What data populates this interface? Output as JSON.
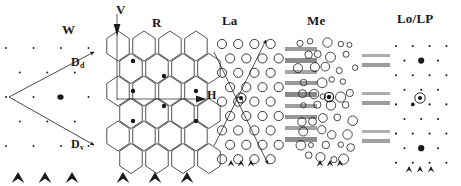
{
  "figure": {
    "width": 461,
    "height": 186,
    "background": "#ffffff",
    "ink": "#1a1a1a",
    "gray_bar_color": "#a8a8a8"
  },
  "regions": [
    {
      "key": "W",
      "label": "W",
      "label_x": 62,
      "label_y": 22,
      "motif": "sparse-dots-with-vector-arrows",
      "description": "Sparse point lattice with two vectors emanating from a common vertex"
    },
    {
      "key": "R",
      "label": "R",
      "label_x": 152,
      "label_y": 17,
      "motif": "honeycomb-hexagon-lattice",
      "description": "Hexagonal honeycomb tiling with filled centre dots"
    },
    {
      "key": "La",
      "label": "La",
      "label_x": 222,
      "label_y": 15,
      "motif": "circle-lattice",
      "description": "Regular lattice of open circles with diagonal vectors"
    },
    {
      "key": "Me",
      "label": "Me",
      "label_x": 307,
      "label_y": 15,
      "motif": "disordered-circles",
      "description": "Disordered circles of varying radii"
    },
    {
      "key": "LoLP",
      "label": "Lo/LP",
      "label_x": 399,
      "label_y": 13,
      "motif": "diffraction-spots",
      "description": "Spot pattern with strong corner reflections and circled origin"
    }
  ],
  "axes": {
    "v_axis": {
      "label": "V",
      "label_x": 116,
      "label_y": 4,
      "direction": "down"
    },
    "h_axis": {
      "label": "H",
      "label_x": 206,
      "label_y": 94,
      "direction": "right"
    }
  },
  "vectors": [
    {
      "name": "Dd",
      "label": "D",
      "subscript": "d",
      "label_x": 72,
      "label_y": 58,
      "from_x": 9,
      "from_y": 97,
      "to_x": 94,
      "to_y": 52
    },
    {
      "name": "Dv",
      "label": "D",
      "subscript": "v",
      "label_x": 72,
      "label_y": 140,
      "from_x": 9,
      "from_y": 97,
      "to_x": 94,
      "to_y": 145
    }
  ],
  "arrowhead_groups": [
    {
      "region": "W",
      "x_positions": [
        18,
        45,
        72
      ],
      "y": 172,
      "size": "large"
    },
    {
      "region": "R",
      "x_positions": [
        123,
        155,
        187
      ],
      "y": 172,
      "size": "large"
    },
    {
      "region": "La",
      "x_positions": [
        231,
        241,
        251
      ],
      "y": 160,
      "size": "small"
    },
    {
      "region": "Me",
      "x_positions": [
        320,
        330,
        340
      ],
      "y": 160,
      "size": "small"
    },
    {
      "region": "LoLP",
      "x_positions": [
        409,
        420,
        431
      ],
      "y": 166,
      "size": "small"
    }
  ],
  "gray_bar_columns": [
    {
      "name": "La-to-Me-bars",
      "x": 285,
      "width": 32,
      "bars": [
        {
          "y": 47,
          "h": 4,
          "shade": "#9a9a9a"
        },
        {
          "y": 58,
          "h": 5,
          "shade": "#8d8d8d"
        },
        {
          "y": 70,
          "h": 4,
          "shade": "#a5a5a5"
        },
        {
          "y": 81,
          "h": 4,
          "shade": "#999999"
        },
        {
          "y": 92,
          "h": 5,
          "shade": "#8a8a8a"
        },
        {
          "y": 104,
          "h": 4,
          "shade": "#a0a0a0"
        },
        {
          "y": 115,
          "h": 4,
          "shade": "#969696"
        },
        {
          "y": 126,
          "h": 4,
          "shade": "#a3a3a3"
        },
        {
          "y": 137,
          "h": 5,
          "shade": "#8f8f8f"
        }
      ]
    },
    {
      "name": "Me-to-LoLP-bars",
      "x": 362,
      "width": 28,
      "bars": [
        {
          "y": 54,
          "h": 3,
          "shade": "#aeaeae"
        },
        {
          "y": 63,
          "h": 4,
          "shade": "#9b9b9b"
        },
        {
          "y": 92,
          "h": 3,
          "shade": "#adadad"
        },
        {
          "y": 101,
          "h": 4,
          "shade": "#9d9d9d"
        },
        {
          "y": 130,
          "h": 3,
          "shade": "#b0b0b0"
        },
        {
          "y": 139,
          "h": 4,
          "shade": "#a0a0a0"
        }
      ]
    }
  ],
  "lattices": {
    "W_dots": {
      "note": "sparse dot array, one bold central dot",
      "center_dot": {
        "x": 60,
        "y": 97,
        "r": 2.6
      }
    },
    "R_hex": {
      "cols": 4,
      "rows": 7,
      "hex_radius": 15,
      "filled_dot_radius": 2.2
    },
    "La_circles": {
      "cols": 5,
      "rows": 9,
      "circle_radius": 4.6,
      "marked_center": {
        "x": 241,
        "y": 98
      }
    },
    "Me_circles": {
      "count": 66,
      "radius_range": [
        2.4,
        5.2
      ],
      "marked_center": {
        "x": 329,
        "y": 97
      }
    },
    "LoLP_spots": {
      "cols": 5,
      "rows": 9,
      "strong_spot_radius": 3.2,
      "weak_spot_radius": 1.1,
      "circled_origin": {
        "x": 420,
        "y": 98,
        "ring_r": 5.2
      }
    }
  }
}
